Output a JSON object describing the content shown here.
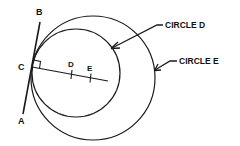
{
  "diagram": {
    "type": "geometry",
    "points": {
      "A": "A",
      "B": "B",
      "C": "C",
      "D": "D",
      "E": "E"
    },
    "callouts": {
      "circle_d": "CIRCLE D",
      "circle_e": "CIRCLE E"
    },
    "colors": {
      "stroke": "#1a1a1a",
      "background": "#ffffff"
    }
  }
}
